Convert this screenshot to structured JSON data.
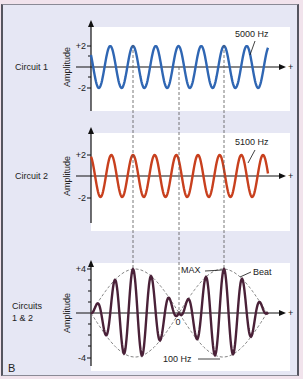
{
  "panel_label": "B",
  "colors": {
    "background": "#e6e7f4",
    "outer": "#f1e3ec",
    "circuit1": "#2f66b3",
    "circuit2": "#c8401e",
    "combined": "#4a2138",
    "envelope": "#777777",
    "plot_bg": "#ffffff"
  },
  "panels": [
    {
      "name": "Circuit 1",
      "row_label": [
        "Circuit 1"
      ],
      "y_axis_label": "Amplitude",
      "ticks": [
        "+2",
        "-2"
      ],
      "freq_label": "5000 Hz",
      "x_axis_end": "+"
    },
    {
      "name": "Circuit 2",
      "row_label": [
        "Circuit 2"
      ],
      "y_axis_label": "Amplitude",
      "ticks": [
        "+2",
        "-2"
      ],
      "freq_label": "5100 Hz",
      "x_axis_end": "+"
    },
    {
      "name": "Circuits 1 & 2",
      "row_label": [
        "Circuits",
        "1 & 2"
      ],
      "y_axis_label": "Amplitude",
      "ticks": [
        "+4",
        "-4"
      ],
      "zero_label": "0",
      "max_label": "MAX",
      "beat_label": "Beat",
      "beat_freq_label": "100 Hz",
      "x_axis_end": "+"
    }
  ]
}
